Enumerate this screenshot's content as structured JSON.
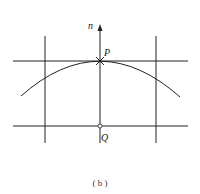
{
  "figure": {
    "caption": "( b )",
    "labels": {
      "normal": "n",
      "point_p": "P",
      "point_q": "Q"
    },
    "colors": {
      "line": "#222222",
      "background": "#ffffff"
    }
  }
}
